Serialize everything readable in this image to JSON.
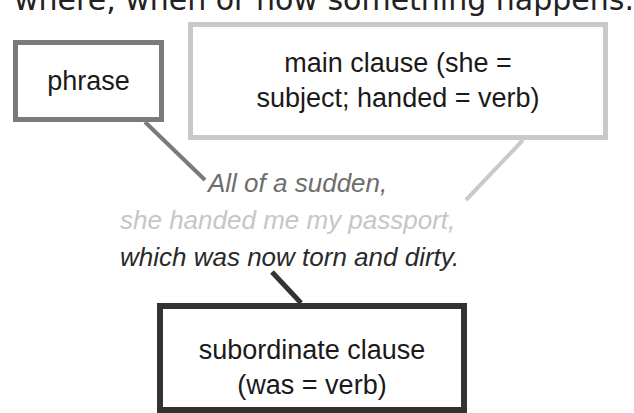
{
  "header": {
    "partial_text": "where, when or how something happens."
  },
  "boxes": {
    "phrase": {
      "label": "phrase",
      "border_color": "#7a7a7a"
    },
    "main_clause": {
      "line1": "main clause (she =",
      "line2": "subject; handed = verb)",
      "border_color": "#c9c9c9"
    },
    "subordinate_clause": {
      "line1": "subordinate clause",
      "line2": "(was = verb)",
      "border_color": "#333333"
    }
  },
  "sentence": {
    "line1": "All of a sudden,",
    "line2": "she handed me my passport,",
    "line3": "which was now torn and dirty."
  }
}
